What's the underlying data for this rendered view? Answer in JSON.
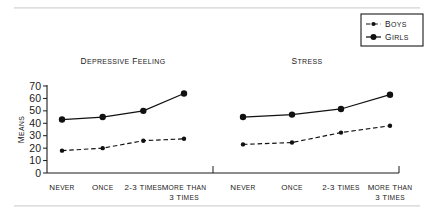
{
  "chart_data": {
    "type": "line",
    "title": "",
    "xlabel": "",
    "ylabel": "MEANS",
    "ylim": [
      0,
      70
    ],
    "yticks": [
      0,
      10,
      20,
      30,
      40,
      50,
      60,
      70
    ],
    "ytick_labels": [
      "0",
      "10",
      "20",
      "30",
      "40",
      "50",
      "60",
      "70"
    ],
    "grid": false,
    "legend_position": "top-right",
    "categories": [
      "NEVER",
      "ONCE",
      "2-3 TIMES",
      "MORE THAN 3 TIMES"
    ],
    "category_lines": [
      [
        "NEVER"
      ],
      [
        "ONCE"
      ],
      [
        "2-3 TIMES"
      ],
      [
        "MORE THAN",
        "3 TIMES"
      ]
    ],
    "panels": [
      {
        "title": "DEPRESSIVE FEELING",
        "series": [
          {
            "name": "BOYS",
            "style": "dashed",
            "marker": "small-dot",
            "values": [
              18,
              20,
              26,
              27.5
            ]
          },
          {
            "name": "GIRLS",
            "style": "solid",
            "marker": "large-dot",
            "values": [
              43,
              45,
              50,
              64
            ]
          }
        ]
      },
      {
        "title": "STRESS",
        "series": [
          {
            "name": "BOYS",
            "style": "dashed",
            "marker": "small-dot",
            "values": [
              23,
              24.5,
              32.5,
              38
            ]
          },
          {
            "name": "GIRLS",
            "style": "solid",
            "marker": "large-dot",
            "values": [
              45,
              47,
              51.5,
              63
            ]
          }
        ]
      }
    ],
    "legend": [
      {
        "label": "BOYS",
        "style": "dashed",
        "marker": "small-dot"
      },
      {
        "label": "GIRLS",
        "style": "solid",
        "marker": "large-dot"
      }
    ],
    "colors": {
      "ink": "#111111",
      "axis": "#1a1a1a",
      "rule": "#d9d9d9",
      "background": "#ffffff"
    }
  }
}
